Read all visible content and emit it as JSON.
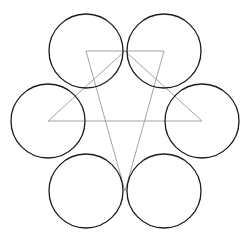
{
  "figure": {
    "background_color": "#ffffff",
    "canvas": {
      "width": 251,
      "height": 240
    },
    "center": {
      "x": 125,
      "y": 121
    },
    "ring_radius": 76,
    "circle_radius": 37,
    "circle_stroke_color": "#1c1c1c",
    "circle_stroke_width": 1.3,
    "triangle_stroke_color": "#9a9a9a",
    "triangle_stroke_width": 0.9
  },
  "chart_data": {
    "type": "scatter",
    "subtitle": "",
    "xlabel": "",
    "ylabel": "",
    "xlim": [
      0,
      251
    ],
    "ylim": [
      0,
      240
    ],
    "grid": false,
    "legend": "none",
    "annotations": [],
    "tick_labels": {
      "x": [],
      "y": []
    },
    "series": [
      {
        "name": "circles",
        "shape": "circle",
        "radius": 37,
        "stroke": "#1c1c1c",
        "stroke_width": 1.3,
        "fill": "none",
        "points": [
          {
            "label": "top-left",
            "x": 86,
            "y": 51
          },
          {
            "label": "top-right",
            "x": 164,
            "y": 51
          },
          {
            "label": "right",
            "x": 202,
            "y": 121
          },
          {
            "label": "bottom-right",
            "x": 164,
            "y": 191
          },
          {
            "label": "bottom-left",
            "x": 86,
            "y": 191
          },
          {
            "label": "left",
            "x": 48,
            "y": 121
          }
        ]
      },
      {
        "name": "triangle-up",
        "shape": "polygon",
        "stroke": "#9a9a9a",
        "stroke_width": 0.9,
        "fill": "none",
        "points": [
          {
            "label": "apex-top",
            "x": 125,
            "y": 51
          },
          {
            "label": "vertex-right",
            "x": 202,
            "y": 121
          },
          {
            "label": "vertex-left",
            "x": 48,
            "y": 121
          }
        ]
      },
      {
        "name": "triangle-down",
        "shape": "polygon",
        "stroke": "#9a9a9a",
        "stroke_width": 0.9,
        "fill": "none",
        "points": [
          {
            "label": "corner-top-left",
            "x": 86,
            "y": 51
          },
          {
            "label": "corner-top-right",
            "x": 164,
            "y": 51
          },
          {
            "label": "apex-bottom",
            "x": 125,
            "y": 191
          }
        ]
      },
      {
        "name": "hexagram-outline",
        "shape": "polygon",
        "stroke": "#9a9a9a",
        "stroke_width": 0.9,
        "fill": "none",
        "points": [
          {
            "label": "p1",
            "x": 86,
            "y": 51
          },
          {
            "label": "p2",
            "x": 164,
            "y": 51
          },
          {
            "label": "p3",
            "x": 202,
            "y": 121
          },
          {
            "label": "p4",
            "x": 164,
            "y": 191
          },
          {
            "label": "p5",
            "x": 86,
            "y": 191
          },
          {
            "label": "p6",
            "x": 48,
            "y": 121
          }
        ]
      }
    ]
  }
}
